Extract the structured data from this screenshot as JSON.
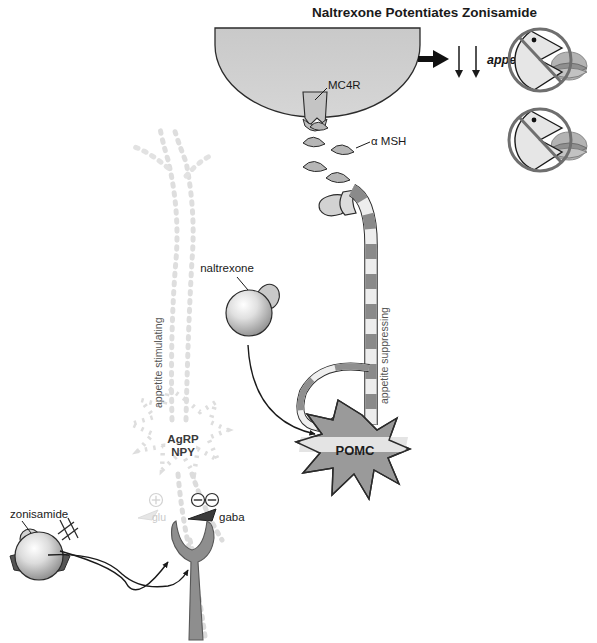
{
  "figure": {
    "title": "Naltrexone Potentiates Zonisamide",
    "domain_kind": "biological-signaling-diagram"
  },
  "labels": {
    "mc4r": "MC4R",
    "alpha_msh": "α MSH",
    "appetite": "appetite",
    "appetite_suppressing": "appetite suppressing",
    "appetite_stimulating": "appetite stimulating",
    "pomc": "POMC",
    "agrp": "AgRP",
    "npy": "NPY",
    "naltrexone": "naltrexone",
    "zonisamide": "zonisamide",
    "glu": "glu",
    "gaba": "gaba",
    "plus_sign": "⊕",
    "minus_sign": "⊖",
    "down_arrow": "↓"
  },
  "icons": {
    "target_neuron": "half-ellipse-cell-body",
    "mc4r_receptor": "cup-receptor-icon",
    "alpha_msh_vesicle": "triangular-vesicle-icon",
    "pomc_axon": "striped-axon-icon",
    "pomc_soma": "star-neuron-icon",
    "naltrexone_molecule": "sphere-ligand-icon",
    "zonisamide_molecule": "sphere-ligand-icon",
    "gaba_terminal": "y-shaped-terminal-icon",
    "agrp_neuron": "dotted-star-neuron-icon",
    "inhibition_marker": "circled-minus-icon",
    "excitation_marker": "circled-plus-icon",
    "right_arrow": "right-arrow-icon",
    "appetite_eating_1": "no-eating-face-icon",
    "appetite_eating_2": "no-eating-face-icon",
    "signal_arrow_naltrexone": "curved-arrow-icon",
    "signal_arrow_zonisamide_agrp": "curved-arrow-icon",
    "signal_arrow_zonisamide_gaba": "curved-arrow-icon"
  },
  "colors": {
    "ink": "#1a1a1a",
    "cell_fill": "#cfcfcf",
    "cell_stroke": "#2b2b2b",
    "stripe_dark": "#8a8a8a",
    "stripe_light": "#eeeeee",
    "pomc_body": "#9a9a9a",
    "pomc_band": "#e4e4e4",
    "vesicle_fill": "#b6b6b6",
    "faded": "#dedede",
    "gaba_fill": "#8e8e8e",
    "molecule_light": "#f2f2f2",
    "molecule_mid": "#b9b9b9",
    "molecule_dark": "#6a6a6a",
    "icon_ring": "#6f6f6f",
    "background": "#ffffff"
  },
  "legend_notes": {
    "appetite_change": "↓ ↓ appetite",
    "arrow_count": 2
  }
}
